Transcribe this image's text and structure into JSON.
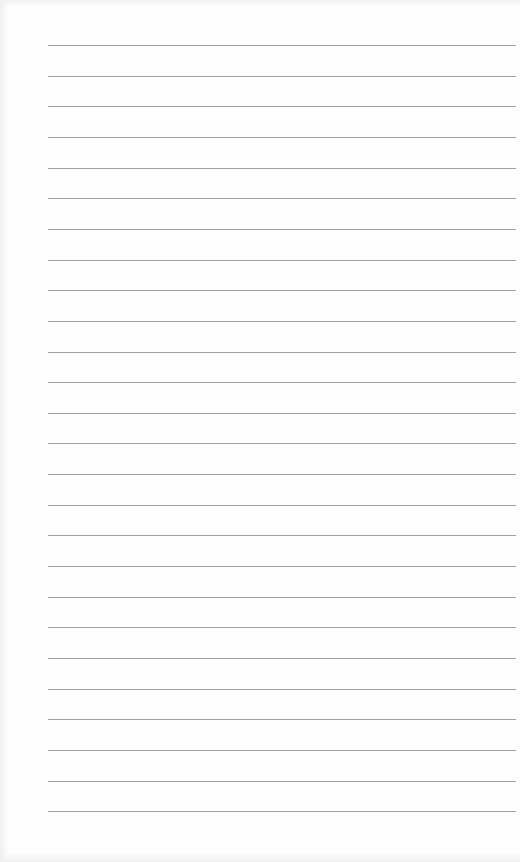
{
  "document": {
    "type": "lined-paper",
    "background_color": "#fdfdfd",
    "rule_color": "#8f8f8f",
    "rule_count": 26,
    "first_rule_y": 45,
    "rule_spacing": 30.65,
    "rule_left": 48,
    "rule_right": 516
  }
}
